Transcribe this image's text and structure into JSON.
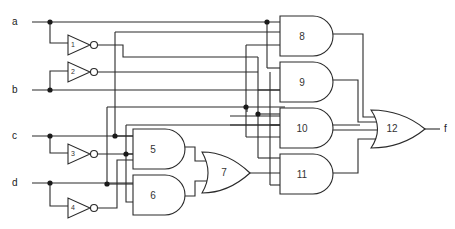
{
  "diagram": {
    "type": "logic-circuit",
    "inputs": [
      "a",
      "b",
      "c",
      "d"
    ],
    "output": "f",
    "inverters": [
      {
        "id": "1",
        "input": "a"
      },
      {
        "id": "2",
        "input": "b"
      },
      {
        "id": "3",
        "input": "c"
      },
      {
        "id": "4",
        "input": "d"
      }
    ],
    "and_gates": [
      "5",
      "6",
      "8",
      "9",
      "10",
      "11"
    ],
    "or_gates": [
      "7",
      "12"
    ],
    "gates": [
      {
        "id": "5",
        "type": "AND"
      },
      {
        "id": "6",
        "type": "AND"
      },
      {
        "id": "7",
        "type": "OR",
        "inputs": [
          "5",
          "6"
        ]
      },
      {
        "id": "8",
        "type": "AND"
      },
      {
        "id": "9",
        "type": "AND"
      },
      {
        "id": "10",
        "type": "AND"
      },
      {
        "id": "11",
        "type": "AND"
      },
      {
        "id": "12",
        "type": "OR",
        "inputs": [
          "8",
          "9",
          "10",
          "11"
        ],
        "output": "f"
      }
    ],
    "stroke_color": "#2a2a2a",
    "background": "#ffffff"
  }
}
